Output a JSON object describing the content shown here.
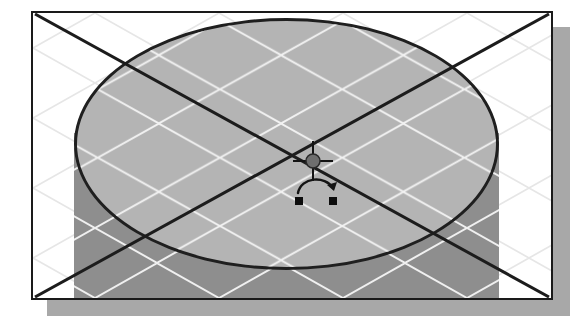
{
  "app": {
    "title": "3D Modeling Viewport",
    "description": "Isometric CAD viewport showing a shaded cylinder primitive on a construction grid"
  },
  "viewport": {
    "name": "perspective-viewport",
    "frame": {
      "x": 31,
      "y": 11,
      "width": 522,
      "height": 289,
      "border_color": "#1a1a1a",
      "border_width": 2,
      "background": "#ffffff"
    },
    "shadow": {
      "offset_x": 16,
      "offset_y": 16,
      "color": "#a8a8a8"
    }
  },
  "scene": {
    "grid": {
      "name": "construction-grid",
      "style": "isometric-diamond",
      "line_color_on_paper": "#e2e2e2",
      "line_color_on_solid": "#f2f2f2",
      "spacing": 62,
      "visible": true
    },
    "axes": {
      "name": "world-axis-lines",
      "color": "#1c1c1c",
      "width": 3,
      "lines": [
        {
          "label": "axis-x",
          "from": [
            34,
            13
          ],
          "to": [
            519,
            286
          ]
        },
        {
          "label": "axis-y",
          "from": [
            519,
            13
          ],
          "to": [
            34,
            286
          ]
        }
      ]
    },
    "object": {
      "name": "cylinder-primitive",
      "type": "cylinder",
      "selected": true,
      "top_cap": {
        "fill": "#b4b4b4",
        "outline": "#1f1f1f",
        "outline_width": 3,
        "cx": 253,
        "cy": 131,
        "rx": 212,
        "ry": 126
      },
      "body": {
        "fill": "#8e8e8e",
        "left": 41,
        "top": 120,
        "width": 425,
        "height": 165
      }
    }
  },
  "widgets": {
    "center_marker": {
      "name": "object-center-crosshair",
      "x": 280,
      "y": 148,
      "dot_color": "#6e6e6e",
      "line_color": "#141414"
    },
    "rotate_gizmo": {
      "name": "rotate-handle-gizmo",
      "x": 286,
      "y": 176,
      "arrow_color": "#141414",
      "handle_color": "#0d0d0d",
      "handle_size": 7,
      "tooltip": "Rotate"
    }
  }
}
